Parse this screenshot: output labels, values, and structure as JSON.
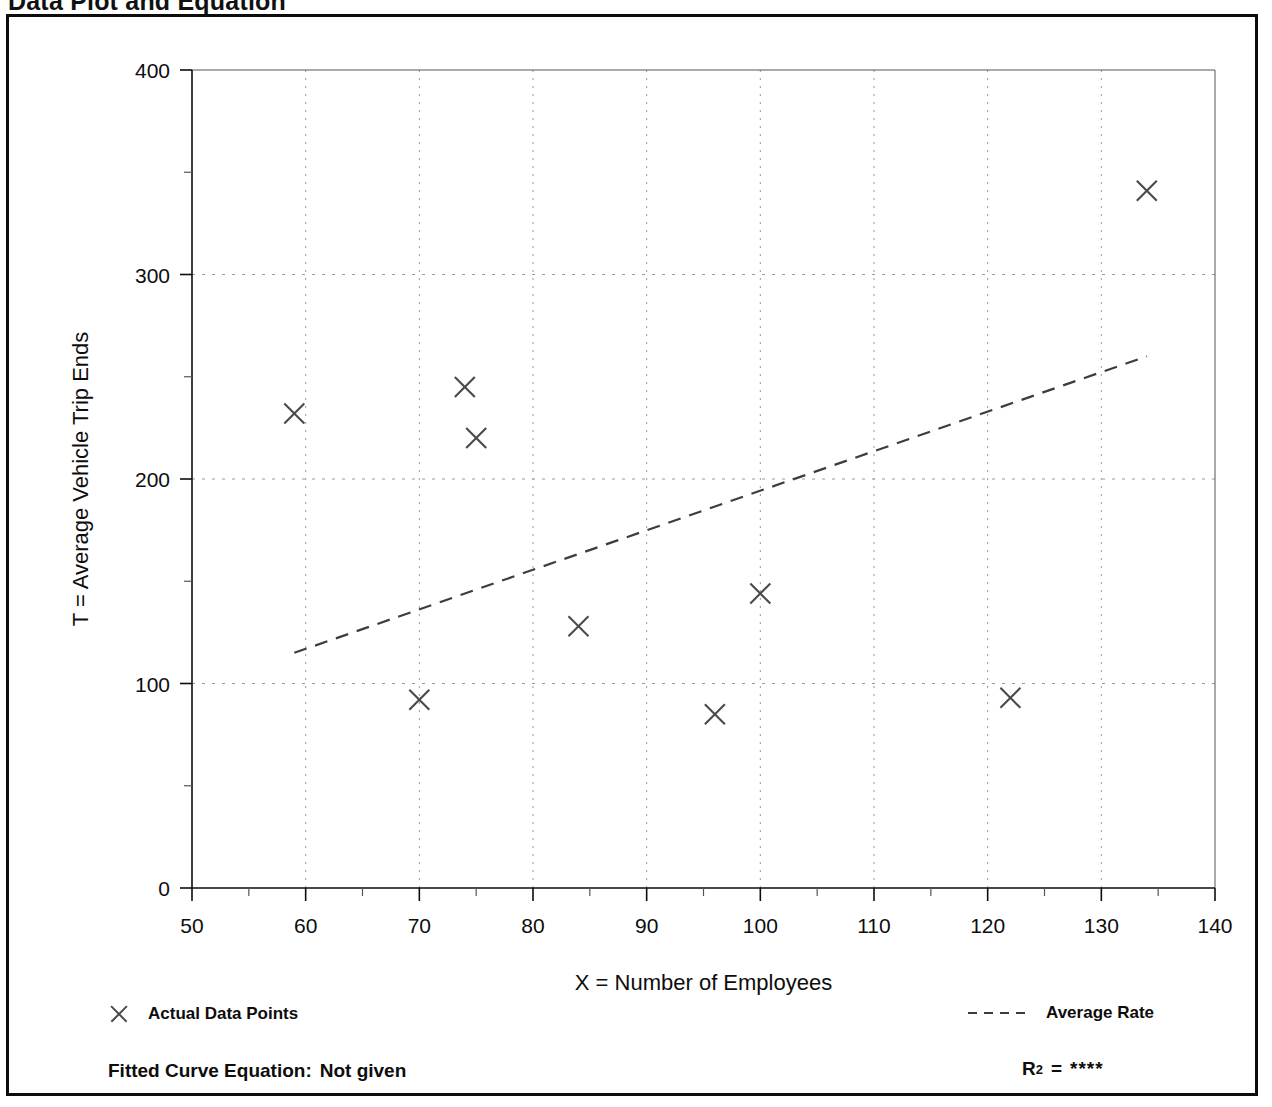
{
  "page": {
    "title": "Data Plot and Equation"
  },
  "legend": {
    "points_marker": "x-mark-icon",
    "points_label": "Actual Data Points",
    "rate_marker": "dashed-line-icon",
    "rate_label": "Average Rate"
  },
  "footer": {
    "equation_label": "Fitted Curve Equation:",
    "equation_value": "Not given",
    "r2_symbol": "R",
    "r2_exponent": "2",
    "r2_equals": "=",
    "r2_value": "****"
  },
  "colors": {
    "ink": "#0d0d0d",
    "grid": "#9a9a9a",
    "marker": "#4a4a4a",
    "trend": "#3d3d3d",
    "frame": "#0d0d0d"
  },
  "chart_data": {
    "type": "scatter",
    "title": "Data Plot and Equation",
    "xlabel": "X = Number of Employees",
    "ylabel": "T = Average Vehicle Trip Ends",
    "xlim": [
      50,
      140
    ],
    "ylim": [
      0,
      400
    ],
    "x_ticks": [
      50,
      60,
      70,
      80,
      90,
      100,
      110,
      120,
      130,
      140
    ],
    "y_ticks": [
      0,
      100,
      200,
      300,
      400
    ],
    "x_minor_step": 5,
    "y_minor_step": 50,
    "grid": true,
    "grid_style": "dotted",
    "legend_position": "below-plot",
    "series": [
      {
        "name": "Actual Data Points",
        "type": "scatter",
        "marker": "x",
        "points": [
          {
            "x": 59,
            "y": 232
          },
          {
            "x": 70,
            "y": 92
          },
          {
            "x": 74,
            "y": 245
          },
          {
            "x": 75,
            "y": 220
          },
          {
            "x": 84,
            "y": 128
          },
          {
            "x": 96,
            "y": 85
          },
          {
            "x": 100,
            "y": 144
          },
          {
            "x": 122,
            "y": 93
          },
          {
            "x": 134,
            "y": 341
          }
        ]
      },
      {
        "name": "Average Rate",
        "type": "line",
        "style": "dashed",
        "points": [
          {
            "x": 59,
            "y": 115
          },
          {
            "x": 134,
            "y": 260
          }
        ]
      }
    ]
  }
}
